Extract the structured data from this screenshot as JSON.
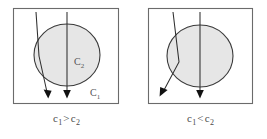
{
  "figure": {
    "name": "refraction-through-circular-medium",
    "background_color": "#ffffff",
    "width": 267,
    "height": 139
  },
  "style": {
    "circle_fill": "#e6e6e6",
    "circle_stroke": "#3a3a3a",
    "box_stroke": "#6b6b6b",
    "ray_stroke": "#2e2e2e",
    "arrow_fill": "#111111",
    "label_color": "#555555",
    "caption_color": "#4a4a4a"
  },
  "panels": [
    {
      "id": "left",
      "caption": {
        "full": "c1 > c2",
        "lhs": "c",
        "lhs_sub": "1",
        "relation": ">",
        "rhs": "c",
        "rhs_sub": "2"
      },
      "labels": [
        {
          "id": "inner",
          "text": "C",
          "sub": "2",
          "x": 76,
          "y": 62
        },
        {
          "id": "outer",
          "text": "C",
          "sub": "1",
          "x": 92,
          "y": 95
        }
      ],
      "box": {
        "x": 13,
        "y": 8,
        "width": 105,
        "height": 95
      },
      "circle": {
        "cx": 67,
        "cy": 55,
        "rx": 33,
        "ry": 31
      },
      "rays": [
        {
          "id": "refracted-ray",
          "type": "refracted",
          "incident": [
            [
              36,
              12
            ],
            [
              39,
              56
            ]
          ],
          "transmitted": [
            [
              39,
              56
            ],
            [
              48,
              95
            ]
          ],
          "arrow_tip": [
            48,
            98
          ]
        },
        {
          "id": "straight-ray",
          "type": "undeviated",
          "incident": [
            [
              67,
              12
            ],
            [
              67,
              95
            ]
          ],
          "transmitted": [],
          "arrow_tip": [
            67,
            98
          ]
        }
      ]
    },
    {
      "id": "right",
      "caption": {
        "full": "c1 < c2",
        "lhs": "c",
        "lhs_sub": "1",
        "relation": "<",
        "rhs": "c",
        "rhs_sub": "2"
      },
      "labels": [],
      "box": {
        "x": 14,
        "y": 8,
        "width": 104,
        "height": 95
      },
      "circle": {
        "cx": 66,
        "cy": 56,
        "rx": 33,
        "ry": 31
      },
      "rays": [
        {
          "id": "refracted-ray",
          "type": "refracted",
          "incident": [
            [
              39,
              12
            ],
            [
              45,
              62
            ]
          ],
          "transmitted": [
            [
              45,
              62
            ],
            [
              28,
              94
            ]
          ],
          "arrow_tip": [
            26,
            98
          ]
        },
        {
          "id": "straight-ray",
          "type": "undeviated",
          "incident": [
            [
              66,
              12
            ],
            [
              66,
              95
            ]
          ],
          "transmitted": [],
          "arrow_tip": [
            66,
            98
          ]
        }
      ]
    }
  ]
}
